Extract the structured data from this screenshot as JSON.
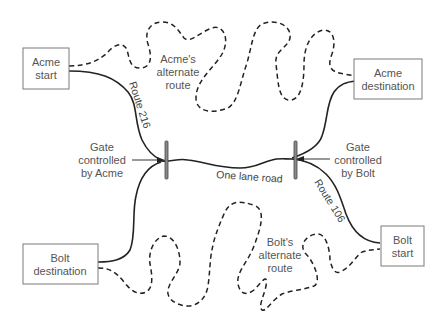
{
  "diagram": {
    "nodes": {
      "acme_start": {
        "line1": "Acme",
        "line2": "start"
      },
      "acme_destination": {
        "line1": "Acme",
        "line2": "destination"
      },
      "bolt_destination": {
        "line1": "Bolt",
        "line2": "destination"
      },
      "bolt_start": {
        "line1": "Bolt",
        "line2": "start"
      }
    },
    "labels": {
      "acme_alternate": {
        "line1": "Acme's",
        "line2": "alternate",
        "line3": "route"
      },
      "bolt_alternate": {
        "line1": "Bolt's",
        "line2": "alternate",
        "line3": "route"
      },
      "gate_acme": {
        "line1": "Gate",
        "line2": "controlled",
        "line3": "by Acme"
      },
      "gate_bolt": {
        "line1": "Gate",
        "line2": "controlled",
        "line3": "by Bolt"
      },
      "route_216": "Route 216",
      "route_106": "Route 106",
      "one_lane_road": "One lane road"
    },
    "legend": {
      "solid_line": "main road",
      "dashed_line": "alternate route"
    },
    "colors": {
      "line": "#222222",
      "box_border": "#7a7a7a",
      "text": "#555555",
      "gate": "#8a8a8a"
    }
  }
}
